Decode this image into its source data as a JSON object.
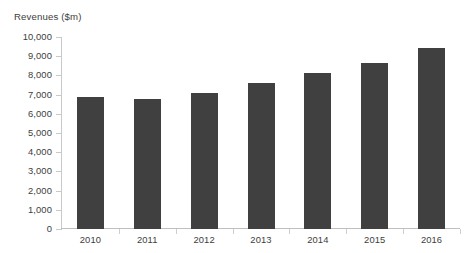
{
  "clipped_top_text": "",
  "chart_data": {
    "type": "bar",
    "title": "",
    "ylabel": "Revenues ($m)",
    "xlabel": "",
    "categories": [
      "2010",
      "2011",
      "2012",
      "2013",
      "2014",
      "2015",
      "2016"
    ],
    "values": [
      6900,
      6750,
      7100,
      7600,
      8150,
      8650,
      9450
    ],
    "series": [
      {
        "name": "Revenues ($m)",
        "values": [
          6900,
          6750,
          7100,
          7600,
          8150,
          8650,
          9450
        ]
      }
    ],
    "ylim": [
      0,
      10000
    ],
    "ytick_values": [
      0,
      1000,
      2000,
      3000,
      4000,
      5000,
      6000,
      7000,
      8000,
      9000,
      10000
    ],
    "ytick_labels": [
      "0",
      "1,000",
      "2,000",
      "3,000",
      "4,000",
      "5,000",
      "6,000",
      "7,000",
      "8,000",
      "9,000",
      "10,000"
    ],
    "grid": false,
    "legend": false,
    "bar_color": "#404040",
    "axis_color": "#c9c9c9",
    "text_color": "#3d3d3d",
    "background": "#ffffff"
  }
}
